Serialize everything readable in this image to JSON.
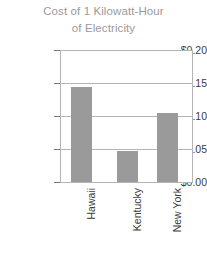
{
  "chart_data": {
    "type": "bar",
    "title": "Cost of 1 Kilowatt-Hour of Electricity",
    "title_lines": [
      "Cost of 1 Kilowatt-Hour",
      "of Electricity"
    ],
    "categories": [
      "Hawaii",
      "Kentucky",
      "New York"
    ],
    "values": [
      0.145,
      0.047,
      0.105
    ],
    "xlabel": "",
    "ylabel": "",
    "ylim": [
      0.0,
      0.2
    ],
    "ytick_values": [
      0.0,
      0.05,
      0.1,
      0.15,
      0.2
    ],
    "ytick_labels": [
      "$0.00",
      "$0.05",
      "$0.10",
      "$0.15",
      "$0.20"
    ],
    "grid": true,
    "legend": false,
    "legend_position": "none",
    "bar_color": "#9a9a9a",
    "axis_color": "#b4b4b4",
    "title_color": "#9a9a9a",
    "tick_label_color": "#3b3b3b",
    "x_label_rotation": 90
  }
}
